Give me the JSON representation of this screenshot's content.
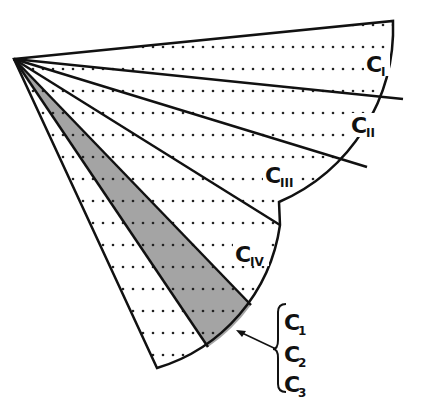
{
  "diagram": {
    "type": "fan-of-sectors",
    "colors": {
      "stroke": "#111111",
      "shade": "#9a9a9a",
      "dots": "#222222",
      "background": "#ffffff"
    },
    "sector_labels": [
      {
        "id": "C_I",
        "main": "C",
        "sub": "I"
      },
      {
        "id": "C_II",
        "main": "C",
        "sub": "II"
      },
      {
        "id": "C_III",
        "main": "C",
        "sub": "III"
      },
      {
        "id": "C_IV",
        "main": "C",
        "sub": "IV"
      }
    ],
    "callout": {
      "labels": [
        {
          "main": "C",
          "sub": "1"
        },
        {
          "main": "C",
          "sub": "2"
        },
        {
          "main": "C",
          "sub": "3"
        }
      ],
      "points_to": "shaded sector"
    }
  }
}
